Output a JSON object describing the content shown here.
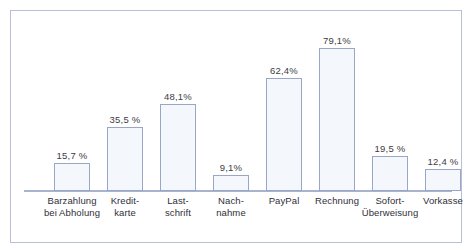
{
  "figure": {
    "clipped_heading_fragment": "",
    "frame_border_color": "#b9bfd4",
    "axis_color": "#aab3cd",
    "bar_fill_color": "#f4f8fc",
    "bar_border_color": "#9aa6c6",
    "label_color": "#2f2f38"
  },
  "chart_data": {
    "type": "bar",
    "title": "",
    "xlabel": "",
    "ylabel": "",
    "ylim": [
      0,
      100
    ],
    "grid": false,
    "legend": null,
    "value_suffix": "%",
    "decimal_separator": ",",
    "categories": [
      "Barzahlung\nbei Abholung",
      "Kredit-\nkarte",
      "Last-\nschrift",
      "Nach-\nnahme",
      "PayPal",
      "Rechnung",
      "Sofort-\nÜberweisung",
      "Vorkasse"
    ],
    "values": [
      15.7,
      35.5,
      48.1,
      9.1,
      62.4,
      79.1,
      19.5,
      12.4
    ],
    "data_labels": [
      "15,7 %",
      "35,5 %",
      "48,1%",
      "9,1%",
      "62,4%",
      "79,1%",
      "19,5 %",
      "12,4 %"
    ]
  }
}
